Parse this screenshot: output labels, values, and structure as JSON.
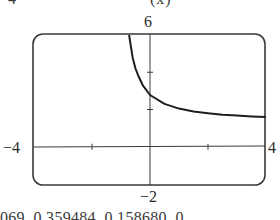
{
  "fragments": {
    "top_left": "4",
    "top_right": "(x)",
    "bottom": "069, 0.359484, 0.158680, 0"
  },
  "chart_data": {
    "type": "line",
    "title": "",
    "xlabel": "",
    "ylabel": "",
    "xlim": [
      -4,
      4
    ],
    "ylim": [
      -2,
      6
    ],
    "x_tick_labels": [
      "-4",
      "4"
    ],
    "y_tick_labels": [
      "-2",
      "6"
    ],
    "x_ticks": [
      -2,
      2
    ],
    "y_ticks": [
      2,
      4
    ],
    "grid": false,
    "legend": null,
    "series": [
      {
        "name": "curve",
        "x": [
          -0.72,
          -0.6,
          -0.5,
          -0.4,
          -0.25,
          0,
          0.5,
          1,
          1.5,
          2,
          2.5,
          3,
          3.5,
          4
        ],
        "y": [
          6.0,
          4.8,
          4.2,
          3.8,
          3.3,
          2.78,
          2.3,
          2.05,
          1.9,
          1.8,
          1.72,
          1.67,
          1.63,
          1.6
        ]
      }
    ],
    "colors": {
      "frame": "#3a3a3a",
      "axes": "#3a3a3a",
      "curve": "#1e1e1e"
    }
  },
  "labels": {
    "ymax": "6",
    "ymin": "−2",
    "xmin": "−4",
    "xmax": "4"
  }
}
